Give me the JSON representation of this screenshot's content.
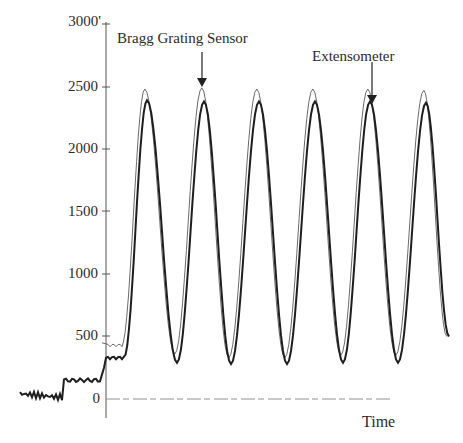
{
  "chart_data": {
    "type": "line",
    "title": "",
    "xlabel": "Time",
    "ylabel": "",
    "ylim": [
      0,
      3000
    ],
    "yticks": [
      0,
      500,
      1000,
      1500,
      2000,
      2500,
      3000
    ],
    "ytick_labels": [
      "0",
      "500",
      "1000",
      "1500",
      "2000",
      "2500",
      "3000'"
    ],
    "grid": false,
    "legend": "none (annotated with arrows)",
    "annotations": [
      {
        "text": "Bragg Grating Sensor",
        "points_to": "peak 2 (thin outer trace)",
        "y": 2500
      },
      {
        "text": "Extensometer",
        "points_to": "peak 5 (thick inner trace)",
        "y": 2380
      }
    ],
    "series": [
      {
        "name": "Bragg Grating Sensor",
        "style": "thin light outline trace",
        "pre_load_level": 430,
        "peaks": [
          2480,
          2490,
          2480,
          2480,
          2480,
          2470
        ],
        "troughs": [
          360,
          330,
          330,
          350,
          350
        ]
      },
      {
        "name": "Extensometer",
        "style": "thick dark trace",
        "pre_load_baseline": [
          0,
          40,
          100,
          170,
          330
        ],
        "pre_load_level": 330,
        "peaks": [
          2390,
          2380,
          2380,
          2380,
          2380,
          2370
        ],
        "troughs": [
          290,
          280,
          280,
          290,
          290
        ]
      }
    ],
    "cycles": 6
  },
  "labels": {
    "x_axis": "Time",
    "annotation_bragg": "Bragg Grating Sensor",
    "annotation_ext": "Extensometer",
    "y_ticks": [
      "3000'",
      "2500",
      "2000",
      "1500",
      "1000",
      "500",
      "0"
    ]
  }
}
